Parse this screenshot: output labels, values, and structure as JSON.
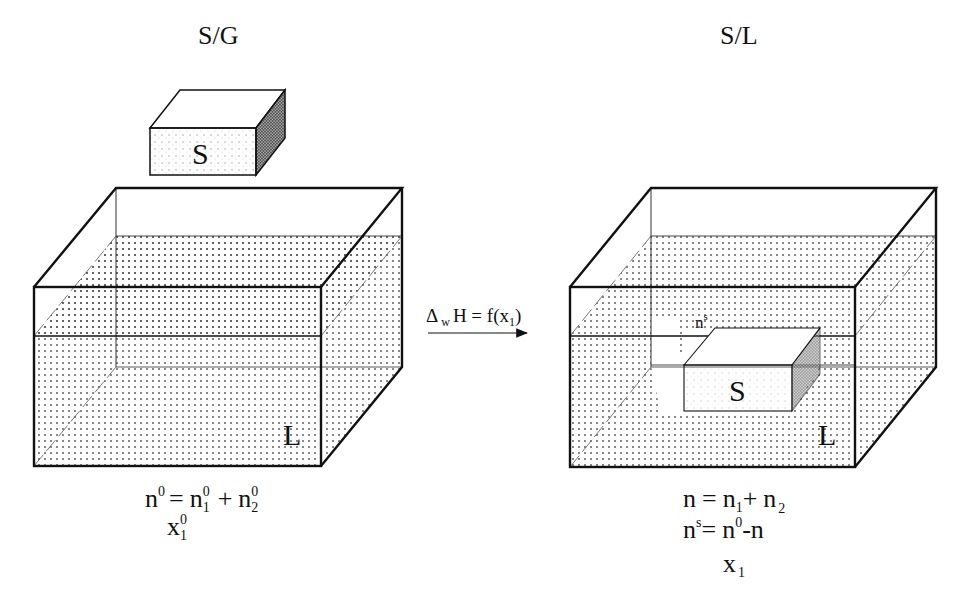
{
  "diagram": {
    "left_panel": {
      "title": "S/G",
      "solid_label": "S",
      "liquid_label": "L",
      "equations": {
        "line1": {
          "lhs": "n",
          "lhs_sup": "0",
          "eq": "=",
          "t1": "n",
          "t1_sub": "1",
          "t1_sup": "0",
          "plus": "+",
          "t2": "n",
          "t2_sub": "2",
          "t2_sup": "0"
        },
        "line2": {
          "var": "x",
          "var_sub": "1",
          "var_sup": "0"
        }
      }
    },
    "transition": {
      "delta": "Δ",
      "delta_sub": "w",
      "rest": "H = f(x",
      "x_sub": "1",
      "close": ")",
      "arrow": "right-arrow"
    },
    "right_panel": {
      "title": "S/L",
      "solid_label": "S",
      "liquid_label": "L",
      "surface_label": "n",
      "surface_label_sup": "s",
      "equations": {
        "line1": {
          "lhs": "n",
          "eq": "=",
          "t1": "n",
          "t1_sub": "1",
          "plus": "+",
          "t2": "n",
          "t2_sub": "2"
        },
        "line2": {
          "lhs": "n",
          "lhs_sup": "s",
          "eq": "=",
          "rhs1": "n",
          "rhs1_sup": "0",
          "minus": "-n"
        },
        "line3": {
          "var": "x",
          "var_sub": "1"
        }
      }
    },
    "colors": {
      "stroke": "#111111",
      "dot": "#555555",
      "background": "#ffffff"
    }
  }
}
